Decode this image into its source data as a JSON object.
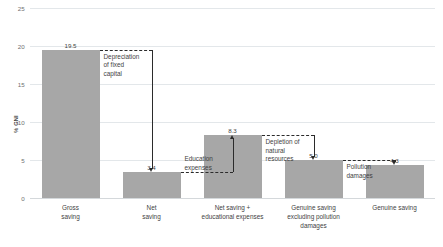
{
  "chart_data": {
    "type": "bar",
    "title": "",
    "subtitle": "",
    "xlabel": "",
    "ylabel": "% GNI",
    "ylim": [
      0,
      25
    ],
    "yticks": [
      "0",
      "5",
      "10",
      "15",
      "20",
      "25"
    ],
    "grid": true,
    "legend": "none",
    "bar_color": "#a7a7a7",
    "categories": [
      "Gross\nsaving",
      "Net\nsaving",
      "Net saving +\neducational expenses",
      "Genuine saving\nexcluding pollution\ndamages",
      "Genuine saving"
    ],
    "values": [
      19.5,
      3.4,
      8.3,
      5.0,
      4.3
    ],
    "value_labels": [
      "19.5",
      "3.4",
      "8.3",
      "5.0",
      "4.3"
    ],
    "annotations": [
      {
        "label": "Depreciation\nof fixed\ncapital",
        "from_value": 19.5,
        "to_value": 3.4,
        "direction": "down"
      },
      {
        "label": "Education\nexpenses",
        "from_value": 3.4,
        "to_value": 8.3,
        "direction": "up"
      },
      {
        "label": "Depletion of\nnatural\nresources",
        "from_value": 8.3,
        "to_value": 5.0,
        "direction": "down"
      },
      {
        "label": "Pollution\ndamages",
        "from_value": 5.0,
        "to_value": 4.3,
        "direction": "down"
      }
    ]
  }
}
